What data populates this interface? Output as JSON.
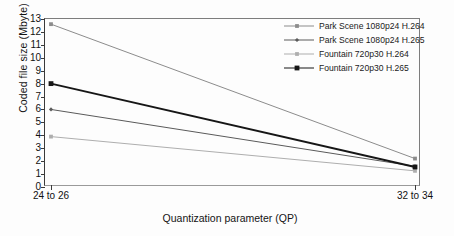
{
  "chart_data": {
    "type": "line",
    "title": "",
    "xlabel": "Quantization parameter (QP)",
    "ylabel": "Coded file size (Mbyte)",
    "categories": [
      "24 to 26",
      "32 to 34"
    ],
    "ylim": [
      0,
      13
    ],
    "ytick_labels": [
      "0",
      "1",
      "2",
      "3",
      "4",
      "5",
      "6",
      "7",
      "8",
      "9",
      "10",
      "11",
      "12",
      "13"
    ],
    "ytick_values": [
      0,
      1,
      2,
      3,
      4,
      5,
      6,
      7,
      8,
      9,
      10,
      11,
      12,
      13
    ],
    "grid": false,
    "legend_position": "top-right",
    "series": [
      {
        "name": "Park Scene 1080p24 H.264",
        "values": [
          12.6,
          2.2
        ],
        "color": "#8c8c8c",
        "width": 1.0,
        "marker": "square"
      },
      {
        "name": "Park Scene 1080p24 H.265",
        "values": [
          6.0,
          1.6
        ],
        "color": "#5a5a5a",
        "width": 1.0,
        "marker": "diamond"
      },
      {
        "name": "Fountain 720p30 H.264",
        "values": [
          3.9,
          1.25
        ],
        "color": "#aeaeae",
        "width": 1.0,
        "marker": "square"
      },
      {
        "name": "Fountain 720p30 H.265",
        "values": [
          8.0,
          1.55
        ],
        "color": "#161616",
        "width": 1.9,
        "marker": "square"
      }
    ]
  },
  "legend": {
    "entries": [
      "Park Scene 1080p24 H.264",
      "Park Scene 1080p24 H.265",
      "Fountain 720p30 H.264",
      "Fountain 720p30 H.265"
    ]
  },
  "axes": {
    "x_title": "Quantization parameter (QP)",
    "y_title": "Coded file size (Mbyte)",
    "x_tick_labels": [
      "24 to 26",
      "32 to 34"
    ],
    "y_tick_labels": [
      "0",
      "1",
      "2",
      "3",
      "4",
      "5",
      "6",
      "7",
      "8",
      "9",
      "10",
      "11",
      "12",
      "13"
    ]
  }
}
